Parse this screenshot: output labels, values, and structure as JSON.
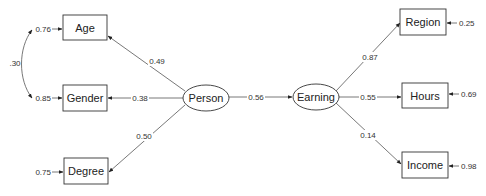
{
  "diagram": {
    "type": "path-diagram",
    "latent_nodes": [
      {
        "id": "person",
        "label": "Person"
      },
      {
        "id": "earning",
        "label": "Earning"
      }
    ],
    "observed_nodes": [
      {
        "id": "age",
        "label": "Age",
        "error": "0.76"
      },
      {
        "id": "gender",
        "label": "Gender",
        "error": "0.85"
      },
      {
        "id": "degree",
        "label": "Degree",
        "error": "0.75"
      },
      {
        "id": "region",
        "label": "Region",
        "error": "0.25"
      },
      {
        "id": "hours",
        "label": "Hours",
        "error": "0.69"
      },
      {
        "id": "income",
        "label": "Income",
        "error": "0.98"
      }
    ],
    "paths": [
      {
        "from": "person",
        "to": "age",
        "coef": "0.49"
      },
      {
        "from": "person",
        "to": "gender",
        "coef": "0.38"
      },
      {
        "from": "person",
        "to": "degree",
        "coef": "0.50"
      },
      {
        "from": "person",
        "to": "earning",
        "coef": "0.56"
      },
      {
        "from": "earning",
        "to": "region",
        "coef": "0.87"
      },
      {
        "from": "earning",
        "to": "hours",
        "coef": "0.55"
      },
      {
        "from": "earning",
        "to": "income",
        "coef": "0.14"
      }
    ],
    "covariances": [
      {
        "between": [
          "age",
          "gender"
        ],
        "coef": ".30"
      }
    ]
  }
}
